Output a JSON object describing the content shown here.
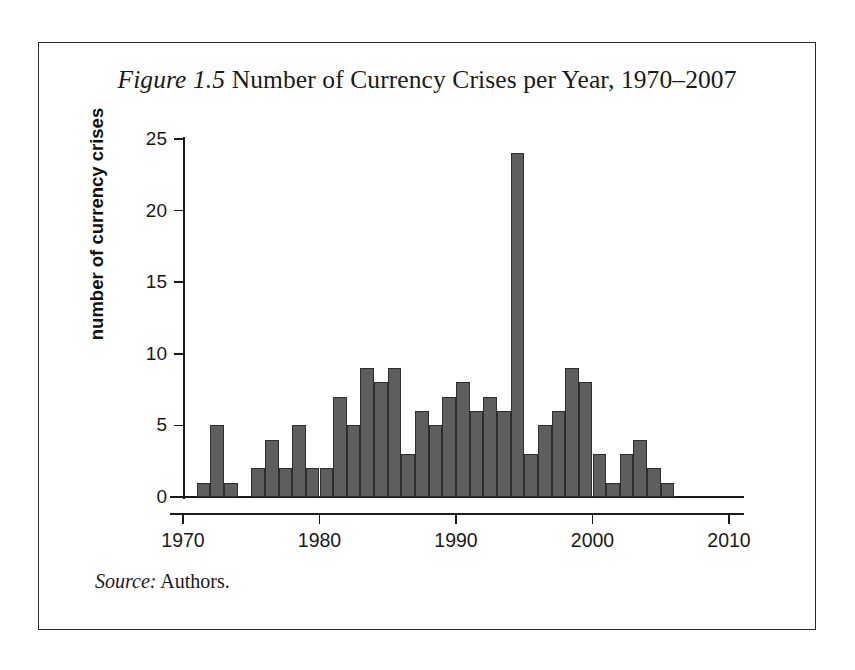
{
  "figure": {
    "label": "Figure 1.5",
    "title_rest": " Number of Currency Crises per Year, 1970–2007",
    "full_title": "Figure 1.5 Number of Currency Crises per Year, 1970–2007",
    "source_label": "Source:",
    "source_text": " Authors."
  },
  "colors": {
    "bar_fill": "#5e5e5e",
    "bar_stroke": "#2e2e2e",
    "axis": "#1a1a1a",
    "frame": "#2b2b2b",
    "background": "#ffffff",
    "text": "#1a1a1a"
  },
  "chart_data": {
    "type": "bar",
    "title": "Figure 1.5 Number of Currency Crises per Year, 1970–2007",
    "xlabel": "",
    "ylabel": "number of currency crises",
    "xlim": [
      1970,
      2010
    ],
    "ylim": [
      0,
      25
    ],
    "grid": false,
    "legend": null,
    "x_ticks": [
      1970,
      1980,
      1990,
      2000,
      2010
    ],
    "x_tick_labels": [
      "1970",
      "1980",
      "1990",
      "2000",
      "2010"
    ],
    "y_ticks": [
      0,
      5,
      10,
      15,
      20,
      25
    ],
    "y_tick_labels": [
      "0",
      "5",
      "10",
      "15",
      "20",
      "25"
    ],
    "categories": [
      "1970",
      "1971",
      "1972",
      "1973",
      "1974",
      "1975",
      "1976",
      "1977",
      "1978",
      "1979",
      "1980",
      "1981",
      "1982",
      "1983",
      "1984",
      "1985",
      "1986",
      "1987",
      "1988",
      "1989",
      "1990",
      "1991",
      "1992",
      "1993",
      "1994",
      "1995",
      "1996",
      "1997",
      "1998",
      "1999",
      "2000",
      "2001",
      "2002",
      "2003",
      "2004",
      "2005",
      "2006",
      "2007"
    ],
    "values": [
      0,
      1,
      5,
      1,
      0,
      2,
      4,
      2,
      5,
      2,
      2,
      7,
      5,
      9,
      8,
      9,
      3,
      6,
      5,
      7,
      8,
      6,
      7,
      6,
      24,
      3,
      5,
      6,
      9,
      8,
      3,
      1,
      3,
      4,
      2,
      1,
      0,
      0
    ],
    "notes": "Source: Authors."
  }
}
